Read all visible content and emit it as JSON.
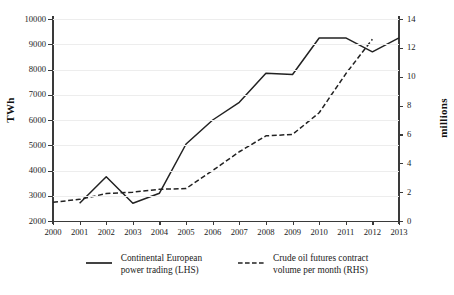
{
  "chart_data": {
    "type": "line",
    "title": "",
    "subtitle": "",
    "xlabel": "",
    "ylabel": "TWh",
    "ylabel_right": "millions",
    "x": [
      2000,
      2001,
      2002,
      2003,
      2004,
      2005,
      2006,
      2007,
      2008,
      2009,
      2010,
      2011,
      2012,
      2013
    ],
    "xticklabels": [
      "2000",
      "2001",
      "2002",
      "2003",
      "2004",
      "2005",
      "2006",
      "2007",
      "2008",
      "2009",
      "2010",
      "2011",
      "2012",
      "2013"
    ],
    "xlim": [
      2000,
      2013
    ],
    "ylim": [
      2000,
      10000
    ],
    "yticks": [
      2000,
      3000,
      4000,
      5000,
      6000,
      7000,
      8000,
      9000,
      10000
    ],
    "yticklabels": [
      "2000",
      "3000",
      "4000",
      "5000",
      "6000",
      "7000",
      "8000",
      "9000",
      "10000"
    ],
    "ylim_right": [
      0,
      14
    ],
    "yticks_right": [
      0,
      2,
      4,
      6,
      8,
      10,
      12,
      14
    ],
    "yticklabels_right": [
      "0",
      "2",
      "4",
      "6",
      "8",
      "10",
      "12",
      "14"
    ],
    "grid": true,
    "grid_axis": "y",
    "legend_position": "bottom-center",
    "series": [
      {
        "name": "Continental European power trading (LHS)",
        "axis": "left",
        "style": "solid",
        "color": "#222222",
        "x": [
          2001,
          2002,
          2003,
          2004,
          2005,
          2006,
          2007,
          2008,
          2009,
          2010,
          2011,
          2012,
          2013
        ],
        "values": [
          2700,
          3750,
          2700,
          3100,
          5050,
          6000,
          6700,
          7850,
          7800,
          9250,
          9250,
          8700,
          9250
        ]
      },
      {
        "name": "Crude oil futures contract volume per month (RHS)",
        "axis": "right",
        "style": "dashed",
        "color": "#222222",
        "x": [
          2000,
          2001,
          2002,
          2003,
          2004,
          2005,
          2006,
          2007,
          2008,
          2009,
          2010,
          2011,
          2012
        ],
        "values": [
          1.3,
          1.5,
          1.9,
          2.0,
          2.2,
          2.25,
          3.5,
          4.8,
          5.9,
          6.0,
          7.5,
          10.2,
          12.6
        ]
      }
    ]
  },
  "axis_titles": {
    "left": "TWh",
    "right": "millions"
  },
  "legend": {
    "items": [
      {
        "label": "Continental European\npower trading (LHS)",
        "style": "solid",
        "color": "#222222"
      },
      {
        "label": "Crude oil futures contract\nvolume per month (RHS)",
        "style": "dashed",
        "color": "#222222"
      }
    ]
  },
  "colors": {
    "series": "#222222",
    "grid": "#ededed",
    "axis": "#3a3a3a",
    "text": "#1a1a1a",
    "background": "#ffffff"
  }
}
